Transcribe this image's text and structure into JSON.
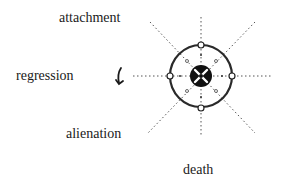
{
  "labels": {
    "attachment": "attachment",
    "regression": "regression",
    "alienation": "alienation",
    "death": "death"
  },
  "diagram": {
    "center": [
      201,
      76
    ],
    "outer_circle_radius": 31,
    "inner_disc_radius": 11,
    "node_count": 4,
    "ray_count": 8,
    "colors": {
      "ink": "#1a1a1a",
      "dotted": "#555555",
      "background": "#ffffff"
    }
  },
  "arrow": {
    "description": "curved-down-arrow next to regression"
  }
}
